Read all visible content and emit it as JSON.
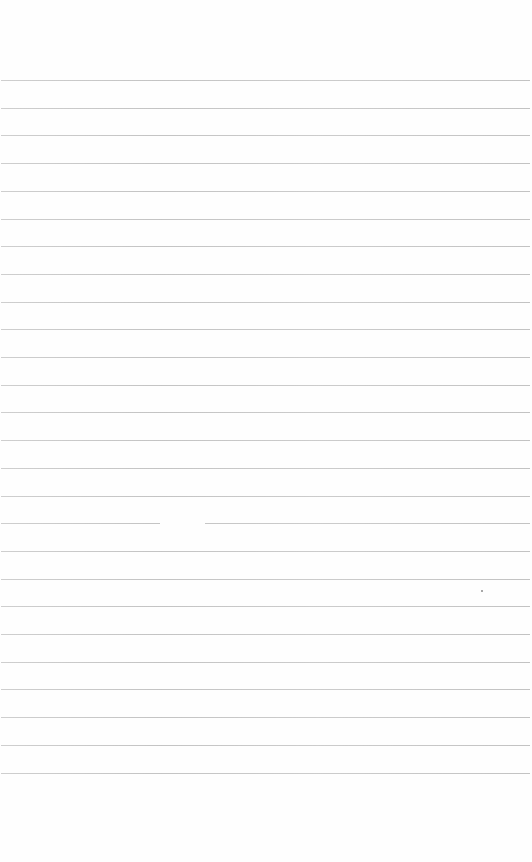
{
  "document": {
    "type": "lined-notebook-page",
    "text_content": "",
    "rule_count": 26,
    "rule_color": "#c4c4c4",
    "background_color": "#fefefe",
    "first_rule_y": 80,
    "rule_spacing_px": 27.7,
    "rule_breaks": [
      {
        "rule_index": 16,
        "x_start": 160,
        "x_end": 205
      }
    ],
    "marks": [
      {
        "type": "speck",
        "x": 481,
        "y": 590
      }
    ]
  }
}
